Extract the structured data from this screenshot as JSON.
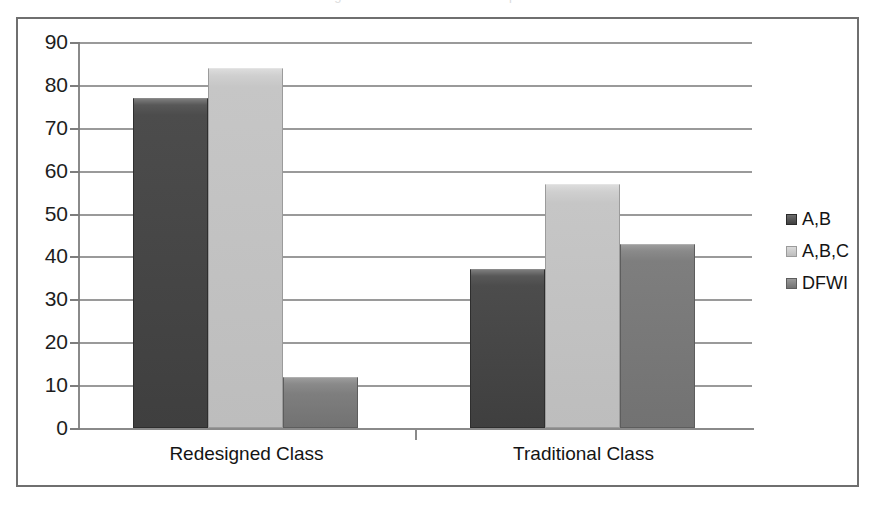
{
  "figure": {
    "cut_off_caption": "Figure 1. Grade distribution comparison",
    "frame_color": "#6f6f6f",
    "background": "#ffffff"
  },
  "chart_data": {
    "type": "bar",
    "title": "",
    "xlabel": "",
    "ylabel": "",
    "categories": [
      "Redesigned Class",
      "Traditional Class"
    ],
    "series": [
      {
        "name": "A,B",
        "values": [
          77,
          37
        ],
        "color": "#4c4c4c"
      },
      {
        "name": "A,B,C",
        "values": [
          84,
          57
        ],
        "color": "#c6c6c6"
      },
      {
        "name": "DFWI",
        "values": [
          12,
          43
        ],
        "color": "#7e7e7e"
      }
    ],
    "ylim": [
      0,
      90
    ],
    "yticks": [
      0,
      10,
      20,
      30,
      40,
      50,
      60,
      70,
      80,
      90
    ],
    "ytick_labels": [
      "0",
      "10",
      "20",
      "30",
      "40",
      "50",
      "60",
      "70",
      "80",
      "90"
    ],
    "grid": true,
    "grid_axis": "y",
    "legend": true,
    "legend_position": "right",
    "legend_entries": [
      "A,B",
      "A,B,C",
      "DFWI"
    ],
    "bar_group_count": 2,
    "bars_per_group": 3
  },
  "axis": {
    "y_label_color": "#1d1d1d",
    "x_label_color": "#141414",
    "gridline_color": "#9a9a9a",
    "axis_line_color": "#8a8a8a"
  },
  "legend": {
    "items": [
      {
        "label": "A,B",
        "swatch": "sw-ab"
      },
      {
        "label": "A,B,C",
        "swatch": "sw-abc"
      },
      {
        "label": "DFWI",
        "swatch": "sw-dfwi"
      }
    ]
  }
}
